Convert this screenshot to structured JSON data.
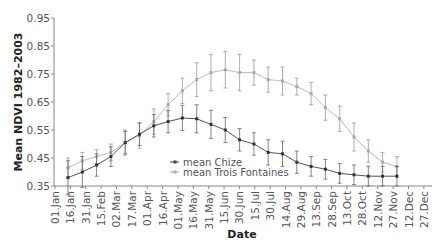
{
  "chart_data": {
    "type": "line",
    "title": "",
    "xlabel": "Date",
    "ylabel": "Mean NDVI 1982–2003",
    "ylim": [
      0.35,
      0.95
    ],
    "yticks": [
      "0.95",
      "0.85",
      "0.75",
      "0.65",
      "0.55",
      "0.45",
      "0.35"
    ],
    "xticks": [
      "01.Jan",
      "16.Jan",
      "31.Jan",
      "15.Feb",
      "02.Mar",
      "17.Mar",
      "01.Apr",
      "16.Apr",
      "01.May",
      "16.May",
      "31.May",
      "15.Jun",
      "30.Jun",
      "15.Jul",
      "30.Jul",
      "14.Aug",
      "29.Aug",
      "13.Sep",
      "28.Sep",
      "13.Oct",
      "28.Oct",
      "12.Nov",
      "27.Nov",
      "12.Dec",
      "27.Dec",
      "11.Jan",
      "26.Jan"
    ],
    "grid": false,
    "legend_position": "center-lower",
    "x": [
      "09.Jan",
      "25.Jan",
      "10.Feb",
      "26.Feb",
      "13.Mar",
      "29.Mar",
      "14.Apr",
      "30.Apr",
      "16.May",
      "01.Jun",
      "17.Jun",
      "03.Jul",
      "19.Jul",
      "04.Aug",
      "20.Aug",
      "05.Sep",
      "21.Sep",
      "07.Oct",
      "23.Oct",
      "08.Nov",
      "24.Nov",
      "10.Dec",
      "26.Dec",
      "11.Jan"
    ],
    "series": [
      {
        "name": "mean Chize",
        "color": "#444444",
        "values": [
          0.38,
          0.4,
          0.425,
          0.455,
          0.505,
          0.535,
          0.565,
          0.58,
          0.593,
          0.59,
          0.57,
          0.55,
          0.515,
          0.5,
          0.47,
          0.465,
          0.435,
          0.42,
          0.41,
          0.395,
          0.39,
          0.385,
          0.385,
          0.385
        ],
        "error": [
          0.06,
          0.055,
          0.04,
          0.035,
          0.04,
          0.04,
          0.04,
          0.04,
          0.045,
          0.05,
          0.05,
          0.045,
          0.04,
          0.04,
          0.045,
          0.045,
          0.04,
          0.035,
          0.035,
          0.035,
          0.035,
          0.035,
          0.035,
          0.035
        ]
      },
      {
        "name": "mean Trois Fontaines",
        "color": "#aaaaaa",
        "values": [
          0.415,
          0.44,
          0.455,
          0.47,
          0.505,
          0.53,
          0.58,
          0.64,
          0.69,
          0.73,
          0.755,
          0.765,
          0.755,
          0.755,
          0.73,
          0.725,
          0.705,
          0.68,
          0.63,
          0.59,
          0.525,
          0.475,
          0.435,
          0.42
        ],
        "error": [
          0.035,
          0.03,
          0.025,
          0.03,
          0.045,
          0.045,
          0.045,
          0.04,
          0.045,
          0.06,
          0.065,
          0.065,
          0.065,
          0.045,
          0.045,
          0.05,
          0.03,
          0.04,
          0.045,
          0.045,
          0.05,
          0.04,
          0.035,
          0.035
        ]
      }
    ]
  },
  "legend": {
    "items": [
      "mean Chize",
      "mean Trois Fontaines"
    ]
  },
  "axes": {
    "xlabel": "Date",
    "ylabel": "Mean NDVI 1982–2003"
  }
}
